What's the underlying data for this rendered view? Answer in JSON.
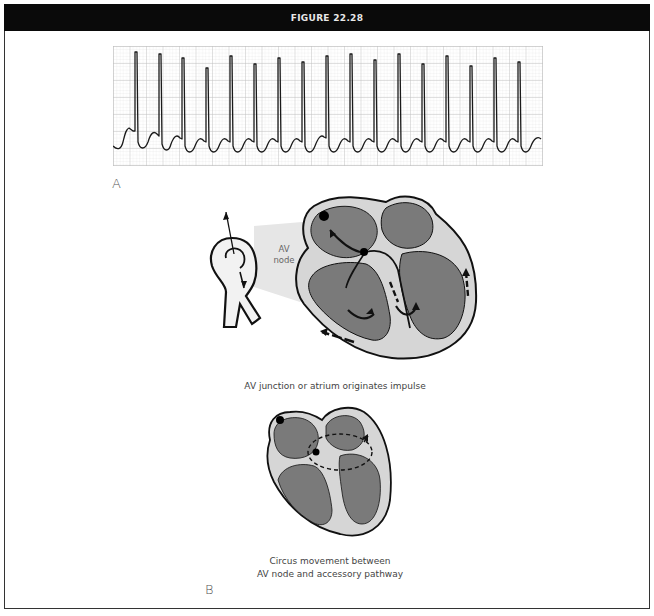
{
  "figure": {
    "title": "FIGURE 22.28",
    "panel_a_label": "A",
    "panel_b_label": "B"
  },
  "ecg_strip": {
    "description": "Narrow-complex tachycardia rhythm strip",
    "beats": 18,
    "grid_color": "#c8c8c8",
    "trace_color": "#1a1a1a"
  },
  "diagram_top": {
    "callout_label": "AV\nnode",
    "callout_line1": "AV",
    "callout_line2": "node",
    "caption": "AV junction or atrium originates impulse"
  },
  "diagram_bottom": {
    "caption_line1": "Circus movement between",
    "caption_line2": "AV node and accessory pathway"
  },
  "colors": {
    "header_bg": "#0a0a0a",
    "chamber": "#7a7a7a",
    "wall": "#d6d6d6",
    "outline": "#111111"
  }
}
